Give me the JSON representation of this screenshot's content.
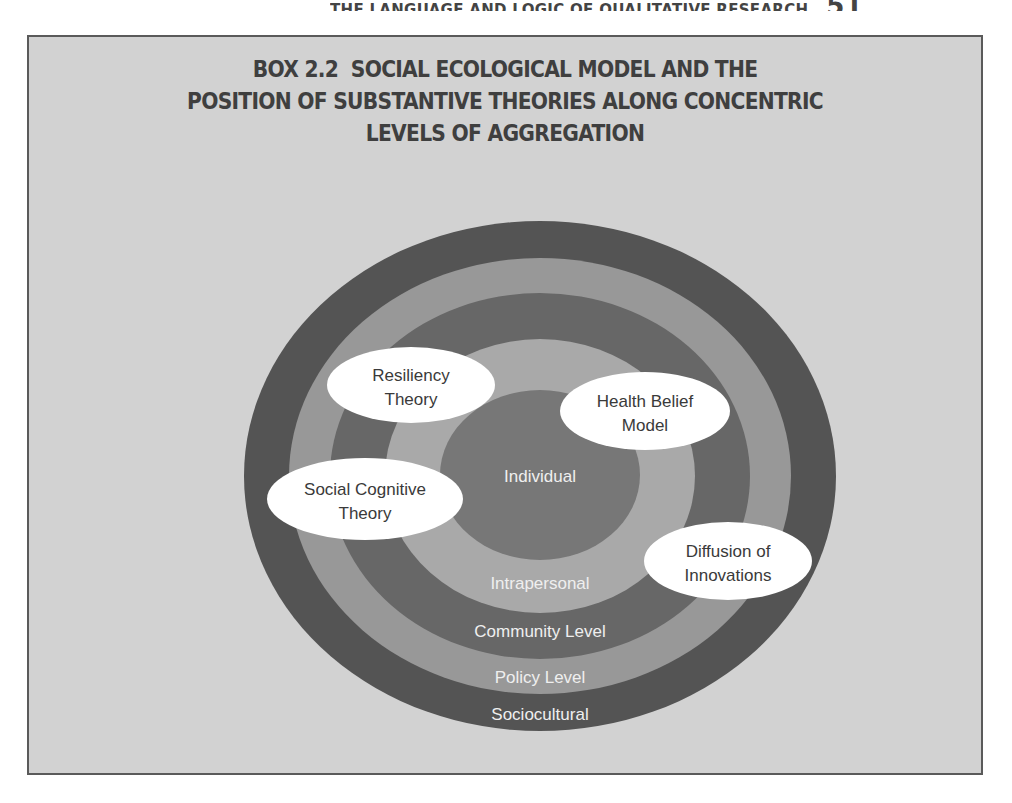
{
  "page": {
    "running_head": "THE LANGUAGE AND LOGIC OF QUALITATIVE RESEARCH",
    "page_number": "51"
  },
  "box": {
    "title_line1": "BOX 2.2  SOCIAL ECOLOGICAL MODEL AND THE",
    "title_line2": "POSITION OF SUBSTANTIVE THEORIES ALONG CONCENTRIC",
    "title_line3": "LEVELS OF AGGREGATION"
  },
  "diagram": {
    "levels": [
      {
        "name": "Sociocultural",
        "color": "#545454"
      },
      {
        "name": "Policy Level",
        "color": "#989898"
      },
      {
        "name": "Community Level",
        "color": "#676767"
      },
      {
        "name": "Intrapersonal",
        "color": "#a9a9a9"
      },
      {
        "name": "Individual",
        "color": "#777777"
      }
    ],
    "theories": [
      {
        "line1": "Resiliency",
        "line2": "Theory"
      },
      {
        "line1": "Health Belief",
        "line2": "Model"
      },
      {
        "line1": "Social Cognitive",
        "line2": "Theory"
      },
      {
        "line1": "Diffusion of",
        "line2": "Innovations"
      }
    ],
    "colors": {
      "background": "#d2d2d2",
      "level_label_text": "#efefef",
      "theory_fill": "#ffffff",
      "theory_text": "#3a3a3a"
    }
  }
}
